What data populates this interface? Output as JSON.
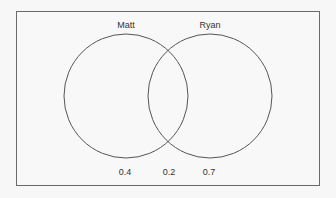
{
  "diagram": {
    "type": "venn",
    "sets": [
      {
        "name": "Matt",
        "label": "Matt",
        "only_value": "0.4"
      },
      {
        "name": "Ryan",
        "label": "Ryan",
        "only_value": "0.7"
      }
    ],
    "intersection_value": "0.2",
    "stroke_color": "#555555",
    "background": "#f8f8f8"
  }
}
